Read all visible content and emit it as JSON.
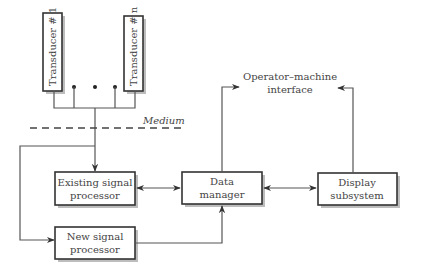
{
  "diagram": {
    "transducers": [
      {
        "label": "Transducer  # 1"
      },
      {
        "label": "Transducer  # n"
      }
    ],
    "ellipsis": "• • •",
    "medium_label": "Medium",
    "operator_interface": {
      "line1": "Operator–machine",
      "line2": "interface"
    },
    "blocks": {
      "existing_processor": {
        "line1": "Existing signal",
        "line2": "processor"
      },
      "new_processor": {
        "line1": "New signal",
        "line2": "processor"
      },
      "data_manager": {
        "line1": "Data",
        "line2": "manager"
      },
      "display_subsystem": {
        "line1": "Display",
        "line2": "subsystem"
      }
    },
    "connections": [
      {
        "from": "Transducers",
        "to": "Existing signal processor",
        "type": "arrow"
      },
      {
        "from": "Transducers",
        "to": "New signal processor",
        "type": "arrow"
      },
      {
        "from": "Existing signal processor",
        "to": "Data manager",
        "type": "bidirectional"
      },
      {
        "from": "New signal processor",
        "to": "Data manager",
        "type": "arrow"
      },
      {
        "from": "Data manager",
        "to": "Display subsystem",
        "type": "bidirectional"
      },
      {
        "from": "Data manager",
        "to": "Operator–machine interface",
        "type": "arrow"
      },
      {
        "from": "Display subsystem",
        "to": "Operator–machine interface",
        "type": "arrow"
      }
    ]
  }
}
